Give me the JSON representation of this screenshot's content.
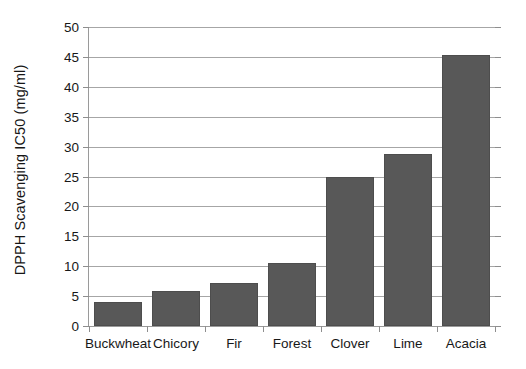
{
  "chart_data": {
    "type": "bar",
    "title": "",
    "xlabel": "",
    "ylabel": "DPPH Scavenging IC50 (mg/ml)",
    "categories": [
      "Buckwheat",
      "Chicory",
      "Fir",
      "Forest",
      "Clover",
      "Lime",
      "Acacia"
    ],
    "values": [
      4.0,
      5.8,
      7.2,
      10.6,
      24.9,
      28.7,
      45.3
    ],
    "ylim": [
      0,
      50
    ],
    "ytick_step": 5,
    "ytick_labels": [
      "0",
      "5",
      "10",
      "15",
      "20",
      "25",
      "30",
      "35",
      "40",
      "45",
      "50"
    ],
    "grid": "horizontal",
    "legend": "none",
    "bar_color": "#585858",
    "gridline_color": "#a6a6a6",
    "axis_color": "#9a9a9a",
    "text_color": "#181818"
  }
}
